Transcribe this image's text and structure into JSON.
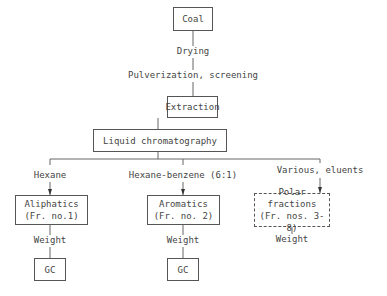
{
  "diagram": {
    "nodes": {
      "coal": "Coal",
      "extraction": "Extraction",
      "lc": "Liquid chromatography",
      "aliphatics": {
        "line1": "Aliphatics",
        "line2": "(Fr. no.1)"
      },
      "aromatics": {
        "line1": "Aromatics",
        "line2": "(Fr. no. 2)"
      },
      "polar": {
        "line1": "Polar fractions",
        "line2": "(Fr. nos. 3-8)"
      },
      "gc1": "GC",
      "gc2": "GC"
    },
    "edges": {
      "drying": "Drying",
      "pulverization": "Pulverization, screening",
      "hexane": "Hexane",
      "hexane_benzene": "Hexane-benzene (6:1)",
      "various": "Various, eluents",
      "weight1": "Weight",
      "weight2": "Weight",
      "weight3": "Weight"
    }
  }
}
